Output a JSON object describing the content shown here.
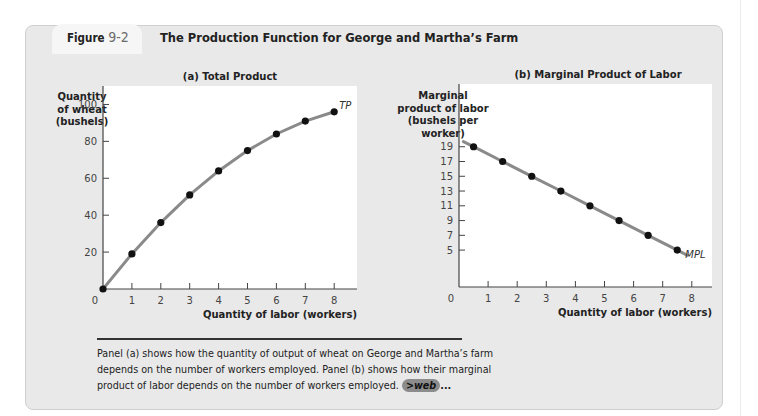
{
  "figure": {
    "label": "Figure",
    "number": "9-2",
    "title": "The Production Function for George and Martha’s Farm"
  },
  "caption": {
    "text": "Panel (a) shows how the quantity of output of wheat on George and Martha’s farm depends on the number of workers employed. Panel (b) shows how their marginal product of labor depends on the number of workers employed.",
    "link_arrow": ">",
    "link_label": "web",
    "link_suffix": "..."
  },
  "colors": {
    "curve": "#8a8a8a",
    "point": "#111111",
    "axis": "#444444",
    "background": "#e9e9e9",
    "plot_bg": "#ffffff"
  },
  "chart_data": [
    {
      "type": "line",
      "title": "(a) Total Product",
      "ylabel": [
        "Quantity",
        "of wheat",
        "(bushels)"
      ],
      "xlabel": "Quantity of labor (workers)",
      "curve_label": "TP",
      "x": [
        0,
        1,
        2,
        3,
        4,
        5,
        6,
        7,
        8
      ],
      "y": [
        0,
        19,
        36,
        51,
        64,
        75,
        84,
        91,
        96
      ],
      "xticks": [
        1,
        2,
        3,
        4,
        5,
        6,
        7,
        8
      ],
      "yticks": [
        20,
        40,
        60,
        80,
        100
      ],
      "origin_label": "0",
      "xlim": [
        0,
        8.8
      ],
      "ylim": [
        0,
        110
      ],
      "grid": false,
      "markers": true
    },
    {
      "type": "line",
      "title": "(b) Marginal Product of Labor",
      "ylabel": [
        "Marginal",
        "product of labor",
        "(bushels per",
        "worker)"
      ],
      "xlabel": "Quantity of labor (workers)",
      "curve_label": "MPL",
      "x": [
        0.5,
        1.5,
        2.5,
        3.5,
        4.5,
        5.5,
        6.5,
        7.5
      ],
      "y": [
        19,
        17,
        15,
        13,
        11,
        9,
        7,
        5
      ],
      "xticks": [
        1,
        2,
        3,
        4,
        5,
        6,
        7,
        8
      ],
      "yticks": [
        5,
        7,
        9,
        11,
        13,
        15,
        17,
        19
      ],
      "origin_label": "0",
      "xlim": [
        0,
        8.8
      ],
      "ylim": [
        0,
        27.5
      ],
      "grid": false,
      "markers": true
    }
  ]
}
